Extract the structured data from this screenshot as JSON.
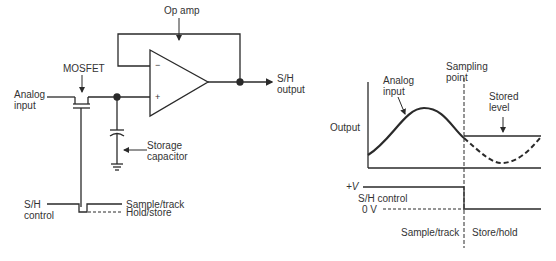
{
  "circuit": {
    "op_amp_label": "Op amp",
    "mosfet_label": "MOSFET",
    "analog_input_label": [
      "Analog",
      "input"
    ],
    "output_label": [
      "S/H",
      "output"
    ],
    "capacitor_label": [
      "Storage",
      "capacitor"
    ],
    "control_label": [
      "S/H",
      "control"
    ],
    "minus_sign": "−",
    "plus_sign": "+",
    "state_high": "Sample/track",
    "state_low": "Hold/store"
  },
  "waveform": {
    "y_axis_label": "Output",
    "analog_input_label": [
      "Analog",
      "input"
    ],
    "sampling_point_label": [
      "Sampling",
      "point"
    ],
    "stored_level_label": [
      "Stored",
      "level"
    ],
    "control_high_label": "+V",
    "control_name_label": "S/H control",
    "control_low_label": "0 V",
    "phase_sample": "Sample/track",
    "phase_hold": "Store/hold"
  },
  "colors": {
    "line": "#2a2a2a",
    "text": "#333333",
    "background": "#ffffff"
  }
}
